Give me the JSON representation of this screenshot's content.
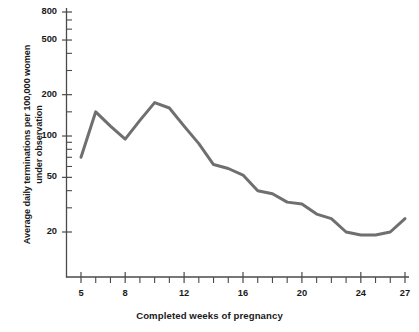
{
  "chart_data": {
    "type": "line",
    "title": "",
    "xlabel": "Completed weeks of pregnancy",
    "ylabel": "Average daily terminations per 100,000 women\nunder observation",
    "yscale": "log",
    "ylim": [
      15,
      900
    ],
    "xlim": [
      4.2,
      27.6
    ],
    "grid": false,
    "legend": null,
    "y_ticklabels": [
      "800",
      "500",
      "200",
      "100",
      "50",
      "20"
    ],
    "y_tickvalues": [
      800,
      500,
      200,
      100,
      50,
      20
    ],
    "y_minor_tickvalues": [
      700,
      600,
      400,
      300,
      150,
      90,
      80,
      70,
      60,
      40,
      30
    ],
    "x_ticklabels": [
      "5",
      "8",
      "12",
      "16",
      "20",
      "24",
      "27"
    ],
    "x_tickvalues": [
      5,
      8,
      12,
      16,
      20,
      24,
      27
    ],
    "x_minor_tickvalues": [
      6,
      7,
      9,
      10,
      11,
      13,
      14,
      15,
      17,
      18,
      19,
      21,
      22,
      23,
      25,
      26
    ],
    "series": [
      {
        "name": "Average daily terminations",
        "color": "#6f6f6f",
        "x": [
          5,
          6,
          7,
          8,
          9,
          10,
          11,
          12,
          13,
          14,
          15,
          16,
          17,
          18,
          19,
          20,
          21,
          22,
          23,
          24,
          25,
          26,
          27
        ],
        "values": [
          70,
          150,
          118,
          95,
          130,
          175,
          160,
          118,
          88,
          62,
          58,
          52,
          40,
          38,
          33,
          32,
          27,
          25,
          20,
          19,
          19,
          20,
          25
        ]
      }
    ]
  },
  "axis": {
    "y_title": "Average daily terminations per 100,000 women\nunder observation",
    "x_title": "Completed weeks of pregnancy"
  },
  "colors": {
    "line": "#6f6f6f",
    "axis": "#4a4a4a",
    "text": "#1a1a1a",
    "background": "#ffffff"
  }
}
